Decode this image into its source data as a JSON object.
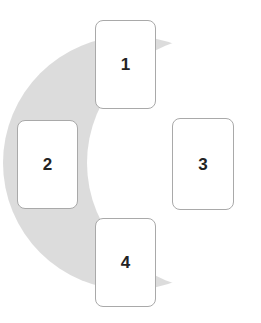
{
  "canvas": {
    "width": 261,
    "height": 323,
    "background_color": "#ffffff"
  },
  "background_shape": {
    "name": "crescent-moon",
    "fill_color": "#dcdcdc",
    "outer_circle": {
      "cx": 130,
      "cy": 163,
      "r": 127
    },
    "inner_circle": {
      "cx": 214,
      "cy": 163,
      "r": 127
    }
  },
  "cards": [
    {
      "label": "1",
      "fill_color": "#ffffff",
      "border_color": "#a9a9a9",
      "text_color": "#232323",
      "x": 95,
      "y": 20,
      "width": 61,
      "height": 89
    },
    {
      "label": "2",
      "fill_color": "#ffffff",
      "border_color": "#a9a9a9",
      "text_color": "#232323",
      "x": 17,
      "y": 120,
      "width": 61,
      "height": 89
    },
    {
      "label": "3",
      "fill_color": "#ffffff",
      "border_color": "#a9a9a9",
      "text_color": "#232323",
      "x": 172,
      "y": 118,
      "width": 62,
      "height": 92
    },
    {
      "label": "4",
      "fill_color": "#ffffff",
      "border_color": "#a9a9a9",
      "text_color": "#232323",
      "x": 95,
      "y": 218,
      "width": 61,
      "height": 89
    }
  ]
}
